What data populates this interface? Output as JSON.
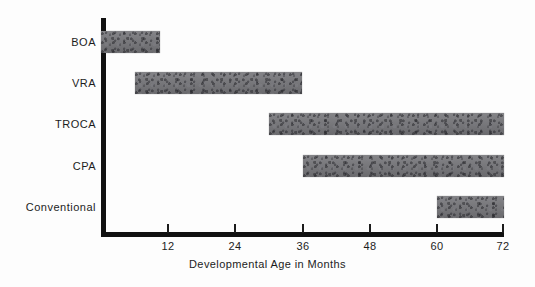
{
  "chart_data": {
    "type": "bar",
    "orientation": "horizontal",
    "subtype": "range-bar",
    "title": "",
    "xlabel": "Developmental Age in Months",
    "ylabel": "",
    "xlim": [
      0,
      72
    ],
    "xticks": [
      12,
      24,
      36,
      48,
      60,
      72
    ],
    "xtick_labels": [
      "12",
      "24",
      "36",
      "48",
      "60",
      "72"
    ],
    "grid": false,
    "legend": "none",
    "categories": [
      "BOA",
      "VRA",
      "TROCA",
      "CPA",
      "Conventional"
    ],
    "bars": [
      {
        "category": "BOA",
        "start": 0,
        "end": 10.5,
        "label": "BOA"
      },
      {
        "category": "VRA",
        "start": 6,
        "end": 36,
        "label": "VRA"
      },
      {
        "category": "TROCA",
        "start": 30,
        "end": 72,
        "label": "TROCA"
      },
      {
        "category": "CPA",
        "start": 36,
        "end": 72,
        "label": "CPA"
      },
      {
        "category": "Conventional",
        "start": 60,
        "end": 72,
        "label": "Conventional"
      }
    ],
    "bar_color": "#76767a",
    "axis_color": "#111111",
    "background_color": "#fdfdfd"
  },
  "axis": {
    "x_title": "Developmental Age in Months",
    "ticks": [
      "12",
      "24",
      "36",
      "48",
      "60",
      "72"
    ]
  },
  "categories": {
    "c0": "BOA",
    "c1": "VRA",
    "c2": "TROCA",
    "c3": "CPA",
    "c4": "Conventional"
  }
}
